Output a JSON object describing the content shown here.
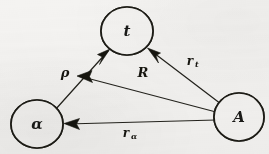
{
  "figure": {
    "type": "vector-diagram",
    "caption": "",
    "background_color": "#f4f3f1",
    "ink_color": "#16150f",
    "nodes": [
      {
        "id": "t",
        "label": "t",
        "name": "node-t",
        "cx": 127,
        "cy": 31,
        "rx": 26,
        "ry": 24,
        "hatched": true,
        "hatch_count": 7
      },
      {
        "id": "alpha",
        "label": "α",
        "name": "node-alpha",
        "cx": 37,
        "cy": 124,
        "rx": 26,
        "ry": 24,
        "hatched": true,
        "hatch_count": 7
      },
      {
        "id": "A",
        "label": "A",
        "name": "node-A",
        "cx": 239,
        "cy": 117,
        "rx": 25,
        "ry": 24,
        "hatched": true,
        "hatch_count": 7
      }
    ],
    "vectors": [
      {
        "id": "r_t",
        "name": "vector-rt",
        "base": "r",
        "subscript": "t",
        "label": "r_t",
        "from": "A",
        "to": "t",
        "x1": 221,
        "y1": 104,
        "x2": 150,
        "y2": 50,
        "label_x": 193,
        "label_y": 62,
        "arrow": "end"
      },
      {
        "id": "R",
        "name": "vector-R",
        "base": "R",
        "subscript": "",
        "label": "R",
        "from": "A",
        "to": "rho-origin",
        "x1": 216,
        "y1": 112,
        "x2": 78,
        "y2": 76,
        "label_x": 143,
        "label_y": 73,
        "arrow": "end"
      },
      {
        "id": "rho",
        "name": "vector-rho",
        "base": "ρ",
        "subscript": "",
        "label": "ρ",
        "from": "alpha",
        "to": "t",
        "x1": 55,
        "y1": 110,
        "x2": 107,
        "y2": 51,
        "label_x": 65,
        "label_y": 73,
        "arrow": "end"
      },
      {
        "id": "r_alpha",
        "name": "vector-ralpha",
        "base": "r",
        "subscript": "α",
        "label": "r_α",
        "from": "A",
        "to": "alpha",
        "x1": 216,
        "y1": 120,
        "x2": 66,
        "y2": 124,
        "label_x": 129,
        "label_y": 134,
        "arrow": "end"
      }
    ]
  }
}
